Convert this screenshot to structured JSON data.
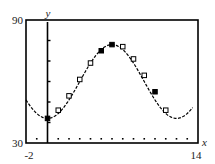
{
  "chart_data": {
    "type": "scatter",
    "title": "",
    "xlabel": "x",
    "ylabel": "y",
    "xlim": [
      -2,
      14
    ],
    "ylim": [
      30,
      90
    ],
    "x_tick_labels": [
      "-2",
      "14"
    ],
    "y_tick_labels": [
      "30",
      "90"
    ],
    "y_axis_tick_step": 10,
    "x_axis_dotted_tick_step": 1,
    "grid": false,
    "legend": null,
    "series": [
      {
        "name": "data points",
        "marker": "square",
        "points": [
          {
            "x": 0,
            "y": 42,
            "filled": true
          },
          {
            "x": 1,
            "y": 46,
            "filled": false
          },
          {
            "x": 2,
            "y": 53,
            "filled": false
          },
          {
            "x": 3,
            "y": 61,
            "filled": false
          },
          {
            "x": 4,
            "y": 69,
            "filled": false
          },
          {
            "x": 5,
            "y": 75,
            "filled": true
          },
          {
            "x": 6,
            "y": 78,
            "filled": true
          },
          {
            "x": 7,
            "y": 77,
            "filled": false
          },
          {
            "x": 8,
            "y": 71,
            "filled": false
          },
          {
            "x": 9,
            "y": 63,
            "filled": false
          },
          {
            "x": 10,
            "y": 55,
            "filled": true
          },
          {
            "x": 11,
            "y": 46,
            "filled": false
          }
        ]
      },
      {
        "name": "model curve",
        "type": "line",
        "style": "solid",
        "equation_hint": "sinusoid: y ≈ 60 + 18·sin(π(x−3)/6)",
        "x_range": [
          -2,
          13.5
        ]
      }
    ]
  },
  "labels": {
    "y_top": "90",
    "y_bottom": "30",
    "x_left": "-2",
    "x_right": "14",
    "x_axis_name": "x",
    "y_axis_name": "y"
  }
}
